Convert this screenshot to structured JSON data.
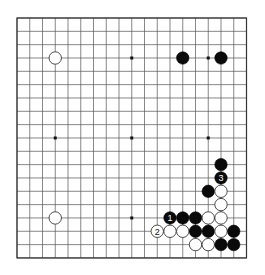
{
  "board": {
    "size": 19,
    "origin": {
      "x": 17,
      "y": 18
    },
    "spacing": {
      "x": 12.75,
      "y": 13.33
    },
    "line_color": "#555555",
    "black_color": "#0a0a0a",
    "white_color": "#ffffff",
    "star_points": [
      [
        3,
        3
      ],
      [
        9,
        3
      ],
      [
        15,
        3
      ],
      [
        3,
        9
      ],
      [
        9,
        9
      ],
      [
        15,
        9
      ],
      [
        3,
        15
      ],
      [
        9,
        15
      ],
      [
        15,
        15
      ]
    ]
  },
  "stones": [
    {
      "color": "white",
      "col": 3,
      "row": 3,
      "label": ""
    },
    {
      "color": "black",
      "col": 13,
      "row": 3,
      "label": ""
    },
    {
      "color": "black",
      "col": 16,
      "row": 3,
      "label": ""
    },
    {
      "color": "white",
      "col": 3,
      "row": 15,
      "label": ""
    },
    {
      "color": "black",
      "col": 16,
      "row": 11,
      "label": ""
    },
    {
      "color": "black",
      "col": 16,
      "row": 12,
      "label": "3"
    },
    {
      "color": "black",
      "col": 15,
      "row": 13,
      "label": ""
    },
    {
      "color": "white",
      "col": 16,
      "row": 13,
      "label": ""
    },
    {
      "color": "white",
      "col": 16,
      "row": 14,
      "label": ""
    },
    {
      "color": "black",
      "col": 12,
      "row": 15,
      "label": "1"
    },
    {
      "color": "black",
      "col": 13,
      "row": 15,
      "label": ""
    },
    {
      "color": "black",
      "col": 14,
      "row": 15,
      "label": ""
    },
    {
      "color": "white",
      "col": 15,
      "row": 15,
      "label": ""
    },
    {
      "color": "white",
      "col": 16,
      "row": 15,
      "label": ""
    },
    {
      "color": "white",
      "col": 11,
      "row": 16,
      "label": "2"
    },
    {
      "color": "white",
      "col": 12,
      "row": 16,
      "label": ""
    },
    {
      "color": "white",
      "col": 13,
      "row": 16,
      "label": ""
    },
    {
      "color": "black",
      "col": 14,
      "row": 16,
      "label": ""
    },
    {
      "color": "black",
      "col": 15,
      "row": 16,
      "label": ""
    },
    {
      "color": "white",
      "col": 16,
      "row": 16,
      "label": ""
    },
    {
      "color": "black",
      "col": 17,
      "row": 16,
      "label": ""
    },
    {
      "color": "white",
      "col": 14,
      "row": 17,
      "label": ""
    },
    {
      "color": "white",
      "col": 15,
      "row": 17,
      "label": ""
    },
    {
      "color": "black",
      "col": 16,
      "row": 17,
      "label": ""
    },
    {
      "color": "black",
      "col": 17,
      "row": 17,
      "label": ""
    }
  ]
}
